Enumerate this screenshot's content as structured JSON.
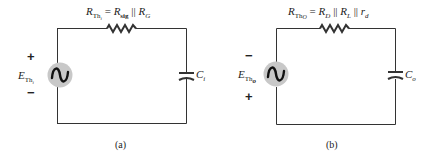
{
  "figure_a": {
    "caption": "(a)",
    "resistor_label": {
      "lhs_main": "R",
      "lhs_sub": "Th",
      "lhs_sub2": "i",
      "equals": " = ",
      "term1_main": "R",
      "term1_sub": "sig",
      "parallel": " || ",
      "term2_main": "R",
      "term2_sub": "G"
    },
    "source_label": {
      "main": "E",
      "sub": "Th",
      "sub2": "i"
    },
    "source_polarity": {
      "top": "+",
      "bottom": "−"
    },
    "capacitor_label": {
      "main": "C",
      "sub": "i"
    }
  },
  "figure_b": {
    "caption": "(b)",
    "resistor_label": {
      "lhs_main": "R",
      "lhs_sub": "Th",
      "lhs_sub2": "O",
      "equals": " = ",
      "term1_main": "R",
      "term1_sub": "D",
      "parallel1": " || ",
      "term2_main": "R",
      "term2_sub": "L",
      "parallel2": " || ",
      "term3_main": "r",
      "term3_sub": "d"
    },
    "source_label": {
      "main": "E",
      "sub": "Th",
      "sub2": "o"
    },
    "source_polarity": {
      "top": "−",
      "bottom": "+"
    },
    "capacitor_label": {
      "main": "C",
      "sub": "o"
    }
  },
  "colors": {
    "wire": "#333333",
    "source_fill": "#c8c8c8",
    "text": "#222222"
  }
}
